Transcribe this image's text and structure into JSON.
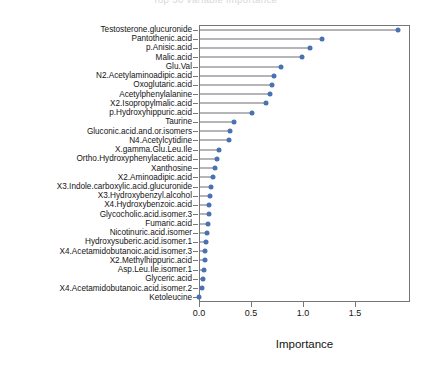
{
  "figure": {
    "header_faint_text": "Top 30 variable importance",
    "background": "#ffffff",
    "point_color": "#4a72b0",
    "stem_color": "#6c6c74",
    "axis_color": "#767676"
  },
  "chart_data": {
    "type": "bar",
    "subtype": "lollipop-horizontal",
    "title": "",
    "xlabel": "Importance",
    "ylabel": "",
    "xlim": [
      0.0,
      2.03
    ],
    "ylim": [
      0,
      29
    ],
    "grid": false,
    "legend": null,
    "xticks": [
      0.0,
      0.5,
      1.0,
      1.5
    ],
    "xticklabels": [
      "0.0",
      "0.5",
      "1.0",
      "1.5"
    ],
    "categories": [
      "Testosterone.glucuronide",
      "Pantothenic.acid",
      "p.Anisic.acid",
      "Malic.acid",
      "Glu.Val",
      "N2.Acetylaminoadipic.acid",
      "Oxoglutaric.acid",
      "Acetylphenylalanine",
      "X2.Isopropylmalic.acid",
      "p.Hydroxyhippuric.acid",
      "Taurine",
      "Gluconic.acid.and.or.isomers",
      "N4.Acetylcytidine",
      "X.gamma.Glu.Leu.Ile",
      "Ortho.Hydroxyphenylacetic.acid",
      "Xanthosine",
      "X2.Aminoadipic.acid",
      "X3.Indole.carboxylic.acid.glucuronide",
      "X3.Hydroxybenzyl.alcohol",
      "X4.Hydroxybenzoic.acid",
      "Glycocholic.acid.isomer.3",
      "Fumaric.acid",
      "Nicotinuric.acid.isomer",
      "Hydroxysuberic.acid.isomer.1",
      "X4.Acetamidobutanoic.acid.isomer.3",
      "X2.Methylhippuric.acid",
      "Asp.Leu.Ile.isomer.1",
      "Glyceric.acid",
      "X4.Acetamidobutanoic.acid.isomer.2",
      "Ketoleucine"
    ],
    "values": [
      1.91,
      1.18,
      1.07,
      0.99,
      0.79,
      0.72,
      0.7,
      0.68,
      0.64,
      0.51,
      0.34,
      0.3,
      0.29,
      0.19,
      0.17,
      0.15,
      0.13,
      0.12,
      0.11,
      0.1,
      0.1,
      0.09,
      0.08,
      0.07,
      0.06,
      0.06,
      0.05,
      0.04,
      0.03,
      0.0
    ]
  }
}
